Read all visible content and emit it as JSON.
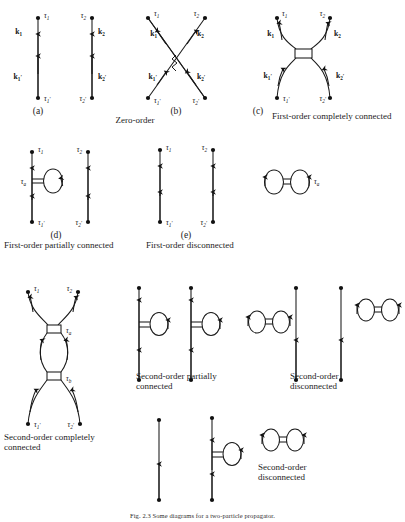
{
  "figure": {
    "caption": "Fig. 2.3 Some diagrams for a two-particle propagator.",
    "background": "#ffffff",
    "ink": "#1a1a1a"
  },
  "labels": {
    "tau1": "τ",
    "tau1_sub": "1",
    "tau2_sub": "2",
    "tau_a_sub": "a",
    "tau_b_sub": "b",
    "prime": "′",
    "k": "k"
  },
  "panels": [
    {
      "id": "a",
      "letter": "(a)",
      "kind": "Zero-order",
      "kind_lines": [
        "Zero-order"
      ],
      "type": "two-free-lines",
      "vertex_labels": [
        "τ1",
        "τ1′",
        "τ2",
        "τ2′"
      ],
      "momentum_labels": [
        "k1",
        "k1′",
        "k2",
        "k2′"
      ]
    },
    {
      "id": "b",
      "letter": "(b)",
      "kind": "",
      "kind_lines": [],
      "type": "crossed-exchange",
      "vertex_labels": [
        "τ1",
        "τ1′",
        "τ2",
        "τ2′"
      ],
      "momentum_labels": [
        "k1",
        "k1′",
        "k2",
        "k2′"
      ]
    },
    {
      "id": "c",
      "letter": "(c)",
      "kind": "First-order completely connected",
      "kind_lines": [
        "First-order completely",
        "connected"
      ],
      "type": "box-vertex-connected",
      "vertex_labels": [
        "τ1",
        "τ1′",
        "τ2",
        "τ2′"
      ],
      "momentum_labels": [
        "k1",
        "k1′",
        "k2",
        "k2′"
      ]
    },
    {
      "id": "d",
      "letter": "(d)",
      "kind": "First-order partially connected",
      "kind_lines": [
        "First-order partially",
        "connected"
      ],
      "type": "tadpole-on-line-plus-free-line",
      "vertex_labels": [
        "τ1",
        "τ1′",
        "τ2",
        "τ2′",
        "τa"
      ],
      "momentum_labels": []
    },
    {
      "id": "e",
      "letter": "(e)",
      "kind": "First-order disconnected",
      "kind_lines": [
        "First-order",
        "disconnected"
      ],
      "type": "two-free-lines-plus-vacuum-loop",
      "vertex_labels": [
        "τ1",
        "τ1′",
        "τ2",
        "τ2′",
        "τa"
      ],
      "momentum_labels": []
    },
    {
      "id": "f",
      "letter": "",
      "kind": "Second-order completely connected",
      "kind_lines": [
        "Second-order",
        "completely connected"
      ],
      "type": "two-box-vertices-bubble",
      "vertex_labels": [
        "τ1",
        "τ2",
        "τ1′",
        "τ2′",
        "τa",
        "τb"
      ],
      "momentum_labels": []
    },
    {
      "id": "g",
      "letter": "",
      "kind": "Second-order partially connected",
      "kind_lines": [
        "Second-order",
        "partially connected"
      ],
      "type": "two-lines-each-with-tadpole",
      "vertex_labels": [],
      "momentum_labels": []
    },
    {
      "id": "h",
      "letter": "",
      "kind": "Second-order disconnected",
      "kind_lines": [
        "Second-order",
        "disconnected"
      ],
      "type": "lines-plus-vacuum-loops",
      "vertex_labels": [],
      "momentum_labels": []
    },
    {
      "id": "i",
      "letter": "",
      "kind": "Second-order disconnected",
      "kind_lines": [
        "Second-order",
        "disconnected"
      ],
      "type": "line-plus-tadpole-line-plus-vacuum-loop",
      "vertex_labels": [],
      "momentum_labels": []
    }
  ]
}
